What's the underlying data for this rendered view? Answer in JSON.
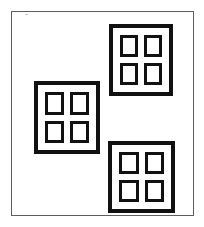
{
  "image": {
    "kind": "line-drawing",
    "subject": "three four-pane windows inside a rectangular border",
    "width": 204,
    "height": 227,
    "background_color": "#ffffff",
    "ink_color": "#111111",
    "border_color": "#5b5f63"
  },
  "page_frame": {
    "name": "outer rectangle border",
    "x": 11,
    "y": 11,
    "width": 183,
    "height": 205,
    "stroke_width": 1,
    "stroke_color": "#5b5f63"
  },
  "artifact": {
    "name": "faint speck",
    "x": 25,
    "y": 14,
    "width": 3,
    "height": 1,
    "color": "#c9ccce"
  },
  "windows": [
    {
      "id": "window-top-right",
      "label": "Top right window",
      "x": 109,
      "y": 24,
      "width": 64,
      "height": 72,
      "frame_stroke": 4,
      "pane_stroke": 3,
      "pane_gutter": 7,
      "pane_gap": 6,
      "pane_count": 4,
      "panes": [
        {
          "id": "pane-1",
          "label": "Top left pane"
        },
        {
          "id": "pane-2",
          "label": "Top right pane"
        },
        {
          "id": "pane-3",
          "label": "Bottom left pane"
        },
        {
          "id": "pane-4",
          "label": "Bottom right pane"
        }
      ]
    },
    {
      "id": "window-middle-left",
      "label": "Middle left window",
      "x": 34,
      "y": 81,
      "width": 66,
      "height": 73,
      "frame_stroke": 4,
      "pane_stroke": 3,
      "pane_gutter": 7,
      "pane_gap": 6,
      "pane_count": 4,
      "panes": [
        {
          "id": "pane-1",
          "label": "Top left pane"
        },
        {
          "id": "pane-2",
          "label": "Top right pane"
        },
        {
          "id": "pane-3",
          "label": "Bottom left pane"
        },
        {
          "id": "pane-4",
          "label": "Bottom right pane"
        }
      ]
    },
    {
      "id": "window-bottom-right",
      "label": "Bottom right window",
      "x": 108,
      "y": 141,
      "width": 67,
      "height": 72,
      "frame_stroke": 4,
      "pane_stroke": 3,
      "pane_gutter": 7,
      "pane_gap": 6,
      "pane_count": 4,
      "panes": [
        {
          "id": "pane-1",
          "label": "Top left pane"
        },
        {
          "id": "pane-2",
          "label": "Top right pane"
        },
        {
          "id": "pane-3",
          "label": "Bottom left pane"
        },
        {
          "id": "pane-4",
          "label": "Bottom right pane"
        }
      ]
    }
  ]
}
